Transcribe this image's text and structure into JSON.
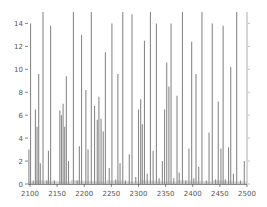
{
  "chart_data": {
    "type": "bar",
    "title": "",
    "xlabel": "",
    "ylabel": "",
    "xlim": [
      2100,
      2500
    ],
    "ylim": [
      0,
      15
    ],
    "x_ticks": [
      2100,
      2150,
      2200,
      2250,
      2300,
      2350,
      2400,
      2450,
      2500
    ],
    "y_ticks": [
      0,
      2,
      4,
      6,
      8,
      10,
      12,
      14
    ],
    "grid": false,
    "legend": null,
    "bar_color": "#8a8a8a",
    "series": [
      {
        "name": "spectrum",
        "points": [
          [
            2098,
            3.0
          ],
          [
            2101,
            14.0
          ],
          [
            2106,
            0.3
          ],
          [
            2110,
            6.5
          ],
          [
            2113,
            5.0
          ],
          [
            2116,
            9.6
          ],
          [
            2119,
            1.8
          ],
          [
            2124,
            15.0
          ],
          [
            2131,
            0.3
          ],
          [
            2134,
            2.9
          ],
          [
            2138,
            13.8
          ],
          [
            2145,
            0.3
          ],
          [
            2155,
            6.4
          ],
          [
            2158,
            6.0
          ],
          [
            2161,
            7.0
          ],
          [
            2164,
            5.0
          ],
          [
            2167,
            9.4
          ],
          [
            2171,
            2.0
          ],
          [
            2180,
            15.0
          ],
          [
            2187,
            0.3
          ],
          [
            2191,
            3.3
          ],
          [
            2195,
            13.0
          ],
          [
            2203,
            8.2
          ],
          [
            2207,
            3.0
          ],
          [
            2213,
            15.0
          ],
          [
            2219,
            6.8
          ],
          [
            2224,
            5.6
          ],
          [
            2227,
            7.6
          ],
          [
            2231,
            5.7
          ],
          [
            2235,
            4.6
          ],
          [
            2239,
            11.5
          ],
          [
            2246,
            1.4
          ],
          [
            2251,
            14.0
          ],
          [
            2258,
            0.4
          ],
          [
            2262,
            9.6
          ],
          [
            2266,
            1.8
          ],
          [
            2271,
            15.0
          ],
          [
            2276,
            0.3
          ],
          [
            2283,
            2.6
          ],
          [
            2288,
            14.8
          ],
          [
            2295,
            0.6
          ],
          [
            2300,
            6.5
          ],
          [
            2304,
            7.4
          ],
          [
            2307,
            5.2
          ],
          [
            2311,
            12.5
          ],
          [
            2316,
            0.9
          ],
          [
            2322,
            15.0
          ],
          [
            2327,
            2.9
          ],
          [
            2333,
            14.0
          ],
          [
            2338,
            0.5
          ],
          [
            2344,
            2.0
          ],
          [
            2348,
            6.5
          ],
          [
            2352,
            10.6
          ],
          [
            2356,
            8.5
          ],
          [
            2360,
            14.0
          ],
          [
            2365,
            0.5
          ],
          [
            2371,
            7.7
          ],
          [
            2375,
            1.0
          ],
          [
            2381,
            15.0
          ],
          [
            2387,
            0.3
          ],
          [
            2393,
            3.1
          ],
          [
            2398,
            12.4
          ],
          [
            2402,
            0.5
          ],
          [
            2406,
            9.6
          ],
          [
            2411,
            1.5
          ],
          [
            2417,
            15.0
          ],
          [
            2425,
            0.3
          ],
          [
            2430,
            4.5
          ],
          [
            2436,
            14.0
          ],
          [
            2442,
            0.4
          ],
          [
            2447,
            7.2
          ],
          [
            2452,
            3.1
          ],
          [
            2456,
            13.8
          ],
          [
            2460,
            0.4
          ],
          [
            2466,
            3.2
          ],
          [
            2470,
            10.2
          ],
          [
            2475,
            0.9
          ],
          [
            2481,
            15.0
          ],
          [
            2488,
            0.3
          ],
          [
            2495,
            2.0
          ]
        ]
      }
    ]
  }
}
